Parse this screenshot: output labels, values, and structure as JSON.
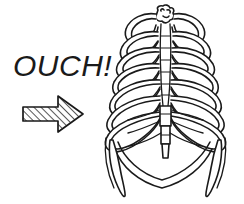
{
  "illustration": {
    "title": "Ribcage line drawing with OUCH exclamation",
    "subject": "human-ribcage-anterior-view",
    "style": "black-and-white line art",
    "background_color": "#ffffff",
    "ink_color": "#1a1a1a"
  },
  "annotation": {
    "text": "OUCH!",
    "font_style": "italic",
    "font_size_px": 30,
    "color": "#1a1a1a"
  },
  "arrow": {
    "name": "pointer-arrow",
    "direction": "right",
    "fill": "hatched-diagonal",
    "outline_color": "#1a1a1a",
    "hatch_color": "#3a3a3a",
    "points_to": "ribcage"
  },
  "ribcage": {
    "view": "anterior",
    "rib_pairs": 10,
    "parts": [
      "clavicle-left",
      "clavicle-right",
      "manubrium",
      "sternum-body",
      "xiphoid-process",
      "ribs-left",
      "ribs-right",
      "costal-cartilage",
      "costal-margin",
      "floating-ribs"
    ],
    "outline_color": "#1a1a1a",
    "fill_color": "#ffffff"
  }
}
